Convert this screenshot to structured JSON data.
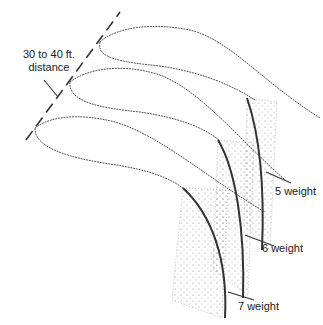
{
  "diagram": {
    "distance_label": {
      "line1": "30 to 40 ft.",
      "line2": "distance"
    },
    "casts": [
      {
        "id": "5",
        "label": "5 weight"
      },
      {
        "id": "6",
        "label": "6 weight"
      },
      {
        "id": "7",
        "label": "7 weight"
      }
    ],
    "colors": {
      "line": "#444444",
      "rod": "#333333",
      "stipple": "#888888"
    }
  }
}
